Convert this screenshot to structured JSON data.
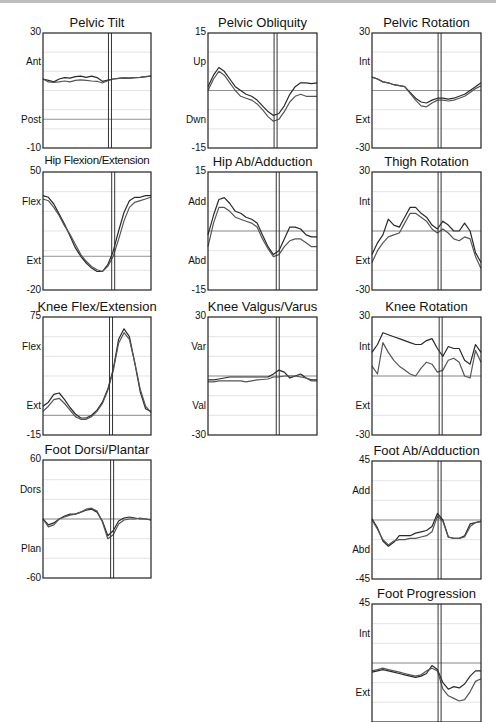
{
  "page": {
    "background": "#ffffff",
    "line_color": "#333333",
    "grid_color": "#d8d8d8",
    "zero_color": "#888888"
  },
  "chart_data": [
    {
      "id": "pelvic-tilt",
      "type": "line",
      "title": "Pelvic Tilt",
      "ylim": [
        -10,
        30
      ],
      "ytick_top": "30",
      "ytick_bottom": "-10",
      "upper_label": "Ant",
      "lower_label": "Post",
      "x": [
        0,
        5,
        10,
        15,
        20,
        25,
        30,
        35,
        40,
        45,
        50,
        55,
        60,
        65,
        70,
        75,
        80,
        85,
        90,
        95,
        100
      ],
      "event_line_x": 62,
      "reference_line": 0,
      "series": [
        {
          "name": "Trial 1",
          "values": [
            14,
            13.5,
            13,
            14,
            14.5,
            14.3,
            14.8,
            15,
            14.6,
            15,
            14.5,
            13.2,
            13.6,
            14,
            14.2,
            14.4,
            14.3,
            14.5,
            14.6,
            14.8,
            15
          ]
        },
        {
          "name": "Trial 2",
          "values": [
            14,
            13,
            12.8,
            13,
            13.3,
            13,
            13.5,
            13.7,
            13.5,
            13.3,
            13.2,
            12.6,
            13.4,
            14,
            14.2,
            14.4,
            14.3,
            14.5,
            14.6,
            14.8,
            15
          ]
        }
      ]
    },
    {
      "id": "pelvic-obliquity",
      "type": "line",
      "title": "Pelvic Obliquity",
      "ylim": [
        -15,
        15
      ],
      "ytick_top": "15",
      "ytick_bottom": "-15",
      "upper_label": "Up",
      "lower_label": "Dwn",
      "x": [
        0,
        5,
        10,
        15,
        20,
        25,
        30,
        35,
        40,
        45,
        50,
        55,
        60,
        65,
        70,
        75,
        80,
        85,
        90,
        95,
        100
      ],
      "event_line_x": 62,
      "reference_line": 0,
      "series": [
        {
          "name": "Trial 1",
          "values": [
            1,
            4,
            6,
            5,
            3,
            1,
            0,
            -1,
            -1.5,
            -2.5,
            -4,
            -5.5,
            -6.5,
            -6,
            -4,
            -1,
            1,
            2,
            2,
            1.8,
            2
          ]
        },
        {
          "name": "Trial 2",
          "values": [
            0,
            3,
            5,
            4,
            2,
            0,
            -1.5,
            -2,
            -2.5,
            -3.5,
            -5,
            -6.8,
            -8,
            -7.5,
            -5.5,
            -3,
            -1.5,
            -1,
            -1.5,
            -1.5,
            -1.5
          ]
        }
      ]
    },
    {
      "id": "pelvic-rotation",
      "type": "line",
      "title": "Pelvic Rotation",
      "ylim": [
        -30,
        30
      ],
      "ytick_top": "30",
      "ytick_bottom": "-30",
      "upper_label": "Int",
      "lower_label": "Ext",
      "x": [
        0,
        5,
        10,
        15,
        20,
        25,
        30,
        35,
        40,
        45,
        50,
        55,
        60,
        65,
        70,
        75,
        80,
        85,
        90,
        95,
        100
      ],
      "event_line_x": 62,
      "reference_line": 0,
      "series": [
        {
          "name": "Trial 1",
          "values": [
            7,
            6,
            4.5,
            4,
            3,
            2.5,
            2,
            -1,
            -4,
            -6,
            -6.5,
            -5,
            -4,
            -4,
            -4.5,
            -4,
            -3,
            -2,
            0,
            2,
            4
          ]
        },
        {
          "name": "Trial 2",
          "values": [
            7,
            6,
            4.5,
            4,
            3,
            2.5,
            2,
            -1.5,
            -5,
            -8,
            -8.5,
            -6.5,
            -5,
            -5,
            -5.5,
            -5,
            -4,
            -3,
            -1,
            1,
            2.5
          ]
        }
      ]
    },
    {
      "id": "hip-flexion-extension",
      "type": "line",
      "title": "Hip Flexion/Extension",
      "ylim": [
        -20,
        50
      ],
      "ytick_top": "50",
      "ytick_bottom": "-20",
      "upper_label": "Flex",
      "lower_label": "Ext",
      "x": [
        0,
        5,
        10,
        15,
        20,
        25,
        30,
        35,
        40,
        45,
        50,
        55,
        60,
        65,
        70,
        75,
        80,
        85,
        90,
        95,
        100
      ],
      "event_line_x": 65,
      "reference_line": 0,
      "series": [
        {
          "name": "Trial 1",
          "values": [
            36,
            35,
            31,
            25,
            19,
            12,
            5,
            0,
            -4,
            -7,
            -9,
            -9,
            -5,
            3,
            15,
            26,
            33,
            35,
            35,
            36,
            36
          ]
        },
        {
          "name": "Trial 2",
          "values": [
            34,
            33,
            29,
            24,
            18,
            13,
            7,
            1,
            -3,
            -6,
            -8,
            -9,
            -6,
            0,
            10,
            21,
            29,
            32,
            33,
            34,
            35
          ]
        }
      ]
    },
    {
      "id": "hip-ab-adduction",
      "type": "line",
      "title": "Hip Ab/Adduction",
      "ylim": [
        -15,
        15
      ],
      "ytick_top": "15",
      "ytick_bottom": "-15",
      "upper_label": "Add",
      "lower_label": "Abd",
      "x": [
        0,
        5,
        10,
        15,
        20,
        25,
        30,
        35,
        40,
        45,
        50,
        55,
        60,
        65,
        70,
        75,
        80,
        85,
        90,
        95,
        100
      ],
      "event_line_x": 64,
      "reference_line": 0,
      "series": [
        {
          "name": "Trial 1",
          "values": [
            -1,
            4,
            8,
            8.5,
            7,
            5,
            4.5,
            3.5,
            3,
            2,
            -1,
            -4,
            -6,
            -5,
            -2,
            1,
            1,
            0.5,
            -1,
            -1.5,
            -1.5
          ]
        },
        {
          "name": "Trial 2",
          "values": [
            -4,
            2,
            6,
            6,
            5,
            3.5,
            3,
            2.5,
            2,
            1,
            -2,
            -4.5,
            -6.5,
            -6,
            -4,
            -2.5,
            -2,
            -2,
            -3,
            -4,
            -4
          ]
        }
      ]
    },
    {
      "id": "thigh-rotation",
      "type": "line",
      "title": "Thigh Rotation",
      "ylim": [
        -30,
        30
      ],
      "ytick_top": "30",
      "ytick_bottom": "-30",
      "upper_label": "Int",
      "lower_label": "Ext",
      "x": [
        0,
        5,
        10,
        15,
        20,
        25,
        30,
        35,
        40,
        45,
        50,
        55,
        60,
        65,
        70,
        75,
        80,
        85,
        90,
        95,
        100
      ],
      "event_line_x": 62,
      "reference_line": 0,
      "series": [
        {
          "name": "Trial 1",
          "values": [
            -12,
            -6,
            -2,
            6,
            3,
            2,
            7,
            12,
            12,
            9,
            7,
            3,
            1,
            5,
            3,
            0,
            0,
            4,
            0,
            -11,
            -16
          ]
        },
        {
          "name": "Trial 2",
          "values": [
            -16,
            -10,
            -6,
            -3,
            -2,
            -1,
            4,
            9,
            9,
            7,
            5,
            1,
            -1,
            1,
            -1,
            -4,
            -5,
            -3,
            -4,
            -13,
            -19
          ]
        }
      ]
    },
    {
      "id": "knee-flex-extension",
      "type": "line",
      "title": "Knee Flex/Extension",
      "ylim": [
        -15,
        75
      ],
      "ytick_top": "75",
      "ytick_bottom": "-15",
      "upper_label": "Flex",
      "lower_label": "Ext",
      "x": [
        0,
        5,
        10,
        15,
        20,
        25,
        30,
        35,
        40,
        45,
        50,
        55,
        60,
        65,
        70,
        75,
        80,
        85,
        90,
        95,
        100
      ],
      "event_line_x": 63,
      "reference_line": 0,
      "series": [
        {
          "name": "Trial 1",
          "values": [
            7,
            10,
            16,
            17,
            12,
            6,
            1,
            -2,
            -2,
            0,
            4,
            10,
            20,
            35,
            58,
            66,
            60,
            40,
            18,
            5,
            3
          ]
        },
        {
          "name": "Trial 2",
          "values": [
            3,
            7,
            12,
            13,
            9,
            4,
            -1,
            -3,
            -3,
            -1,
            3,
            9,
            19,
            34,
            55,
            63,
            58,
            40,
            20,
            7,
            2
          ]
        }
      ]
    },
    {
      "id": "knee-valgus-varus",
      "type": "line",
      "title": "Knee Valgus/Varus",
      "ylim": [
        -30,
        30
      ],
      "ytick_top": "30",
      "ytick_bottom": "-30",
      "upper_label": "Var",
      "lower_label": "Val",
      "x": [
        0,
        5,
        10,
        15,
        20,
        25,
        30,
        35,
        40,
        45,
        50,
        55,
        60,
        65,
        70,
        75,
        80,
        85,
        90,
        95,
        100
      ],
      "event_line_x": 64,
      "reference_line": 0,
      "series": [
        {
          "name": "Trial 1",
          "values": [
            -2,
            -2,
            -1.5,
            -1,
            -0.5,
            -0.5,
            -0.5,
            -0.5,
            -0.5,
            -0.5,
            -0.5,
            -0.5,
            1,
            3,
            2,
            -1,
            0,
            1,
            -1,
            -2,
            -2
          ]
        },
        {
          "name": "Trial 2",
          "values": [
            -3,
            -3,
            -2.5,
            -2.5,
            -2.5,
            -2.5,
            -2.5,
            -3,
            -2.5,
            -2,
            -1.8,
            -1.5,
            -0.5,
            -0.5,
            0,
            0,
            0,
            -0.5,
            -1,
            -2.5,
            -2.5
          ]
        }
      ]
    },
    {
      "id": "knee-rotation",
      "type": "line",
      "title": "Knee Rotation",
      "ylim": [
        -30,
        30
      ],
      "ytick_top": "30",
      "ytick_bottom": "-30",
      "upper_label": "Int",
      "lower_label": "Ext",
      "x": [
        0,
        5,
        10,
        15,
        20,
        25,
        30,
        35,
        40,
        45,
        50,
        55,
        60,
        65,
        70,
        75,
        80,
        85,
        90,
        95,
        100
      ],
      "event_line_x": 63,
      "reference_line": 0,
      "series": [
        {
          "name": "Trial 1",
          "values": [
            12,
            16,
            22,
            21,
            20,
            19,
            18,
            17,
            16,
            16,
            18,
            19,
            14,
            10,
            15,
            14,
            14,
            8,
            6,
            16,
            12
          ]
        },
        {
          "name": "Trial 2",
          "values": [
            5,
            1,
            17,
            12,
            8,
            5,
            3,
            1,
            0,
            4,
            7,
            6,
            2,
            3,
            8,
            9,
            7,
            0,
            -1,
            13,
            7
          ]
        }
      ]
    },
    {
      "id": "foot-dorsi-plantar",
      "type": "line",
      "title": "Foot Dorsi/Plantar",
      "ylim": [
        -60,
        60
      ],
      "ytick_top": "60",
      "ytick_bottom": "-60",
      "upper_label": "Dors",
      "lower_label": "Plan",
      "x": [
        0,
        5,
        10,
        15,
        20,
        25,
        30,
        35,
        40,
        45,
        50,
        55,
        60,
        65,
        70,
        75,
        80,
        85,
        90,
        95,
        100
      ],
      "event_line_x": 64,
      "reference_line": 0,
      "series": [
        {
          "name": "Trial 1",
          "values": [
            0,
            -6,
            -4,
            0,
            3,
            5,
            5,
            7,
            9,
            10,
            7,
            -2,
            -17,
            -12,
            -2,
            1,
            2,
            1,
            0,
            0,
            -1
          ]
        },
        {
          "name": "Trial 2",
          "values": [
            0,
            -8,
            -6,
            0,
            2,
            4,
            5,
            7,
            10,
            11,
            8,
            -3,
            -20,
            -16,
            -5,
            -1,
            0,
            0,
            1,
            0,
            -1
          ]
        }
      ]
    },
    {
      "id": "foot-ab-adduction",
      "type": "line",
      "title": "Foot Ab/Adduction",
      "ylim": [
        -45,
        45
      ],
      "ytick_top": "45",
      "ytick_bottom": "-45",
      "upper_label": "Add",
      "lower_label": "Abd",
      "x": [
        0,
        5,
        10,
        15,
        20,
        25,
        30,
        35,
        40,
        45,
        50,
        55,
        60,
        65,
        70,
        75,
        80,
        85,
        90,
        95,
        100
      ],
      "event_line_x": 62,
      "reference_line": 0,
      "series": [
        {
          "name": "Trial 1",
          "values": [
            1,
            -6,
            -16,
            -20,
            -17,
            -12,
            -12,
            -12,
            -10,
            -9,
            -8,
            -5,
            5,
            0,
            -13,
            -14,
            -14,
            -12,
            -3,
            -2,
            -1
          ]
        },
        {
          "name": "Trial 2",
          "values": [
            0,
            -7,
            -15,
            -19,
            -16,
            -15,
            -15,
            -14,
            -14,
            -13,
            -12,
            -9,
            3,
            -1,
            -13,
            -14,
            -14,
            -13,
            -5,
            -2,
            -1
          ]
        }
      ]
    },
    {
      "id": "foot-progression",
      "type": "line",
      "title": "Foot Progression",
      "ylim": [
        -45,
        45
      ],
      "ytick_top": "45",
      "ytick_bottom": "",
      "upper_label": "Int",
      "lower_label": "Ext",
      "x": [
        0,
        5,
        10,
        15,
        20,
        25,
        30,
        35,
        40,
        45,
        50,
        55,
        60,
        65,
        70,
        75,
        80,
        85,
        90,
        95,
        100
      ],
      "event_line_x": 62,
      "reference_line": 0,
      "series": [
        {
          "name": "Trial 1",
          "values": [
            -7,
            -6,
            -5,
            -6,
            -7,
            -8,
            -9,
            -10,
            -11,
            -10,
            -8,
            -2,
            -5,
            -15,
            -20,
            -18,
            -19,
            -16,
            -10,
            -6,
            -6
          ]
        },
        {
          "name": "Trial 2",
          "values": [
            -6,
            -5,
            -4,
            -5,
            -6,
            -7,
            -8,
            -9,
            -10,
            -9,
            -6,
            -4,
            -6,
            -20,
            -25,
            -27,
            -29,
            -28,
            -22,
            -14,
            -12
          ]
        }
      ]
    }
  ]
}
